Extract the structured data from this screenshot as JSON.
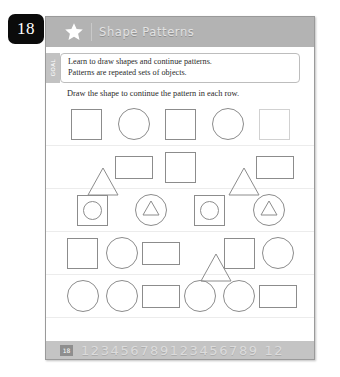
{
  "page_badge": {
    "number": "18"
  },
  "header": {
    "title": "Shape Patterns",
    "star_icon": "star-icon"
  },
  "goal": {
    "tab_label": "GOAL",
    "lines": [
      "Learn to draw shapes and continue patterns.",
      "Patterns are repeated sets of objects."
    ]
  },
  "task": {
    "instruction": "Draw the shape to continue the pattern in each row."
  },
  "rows": [
    {
      "name": "pattern-row-1",
      "shapes": [
        {
          "type": "square",
          "faded": false
        },
        {
          "type": "circle",
          "faded": false
        },
        {
          "type": "square",
          "faded": false
        },
        {
          "type": "circle",
          "faded": false
        },
        {
          "type": "square",
          "faded": true
        }
      ]
    },
    {
      "name": "pattern-row-2",
      "shapes": [
        {
          "type": "triangle",
          "faded": false
        },
        {
          "type": "rectangle",
          "faded": false
        },
        {
          "type": "square",
          "faded": false
        },
        {
          "type": "triangle",
          "faded": false
        },
        {
          "type": "rectangle",
          "faded": false
        }
      ]
    },
    {
      "name": "pattern-row-3",
      "shapes": [
        {
          "type": "circle-in-square",
          "faded": false
        },
        {
          "type": "triangle-in-circle",
          "faded": false
        },
        {
          "type": "circle-in-square",
          "faded": false
        },
        {
          "type": "triangle-in-circle",
          "faded": false
        }
      ]
    },
    {
      "name": "pattern-row-4",
      "shapes": [
        {
          "type": "square",
          "faded": false
        },
        {
          "type": "circle",
          "faded": false
        },
        {
          "type": "rectangle",
          "faded": false
        },
        {
          "type": "triangle",
          "faded": false
        },
        {
          "type": "square",
          "faded": false
        },
        {
          "type": "circle",
          "faded": false
        }
      ]
    },
    {
      "name": "pattern-row-5",
      "shapes": [
        {
          "type": "circle",
          "faded": false
        },
        {
          "type": "circle",
          "faded": false
        },
        {
          "type": "rectangle",
          "faded": false
        },
        {
          "type": "circle",
          "faded": false
        },
        {
          "type": "circle",
          "faded": false
        },
        {
          "type": "rectangle",
          "faded": false
        }
      ]
    }
  ],
  "footer": {
    "badge": "18",
    "digits": "123456789123456789 12"
  },
  "colors": {
    "header_band": "#b3b3b3",
    "footer_band": "#c4c4c4",
    "badge_bg": "#0b0b0b",
    "shape_stroke": "#8c8c8c",
    "goal_tab": "#c2c2c2"
  }
}
